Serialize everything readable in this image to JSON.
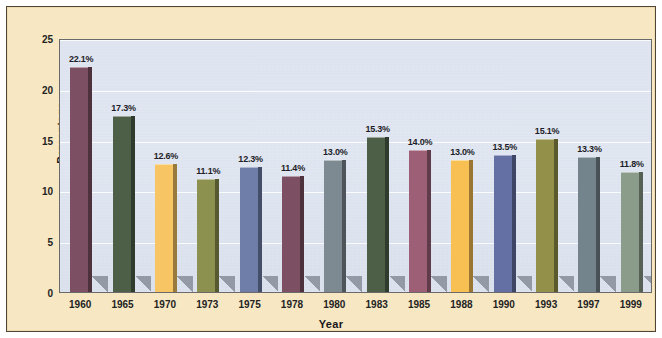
{
  "chart_data": {
    "type": "bar",
    "title": "",
    "xlabel": "Year",
    "ylabel": "Percentage",
    "categories": [
      "1960",
      "1965",
      "1970",
      "1973",
      "1975",
      "1978",
      "1980",
      "1983",
      "1985",
      "1988",
      "1990",
      "1993",
      "1997",
      "1999"
    ],
    "values": [
      22.1,
      17.3,
      12.6,
      11.1,
      12.3,
      11.4,
      13.0,
      15.3,
      14.0,
      13.0,
      13.5,
      15.1,
      13.3,
      11.8
    ],
    "data_labels": [
      "22.1%",
      "17.3%",
      "12.6%",
      "11.1%",
      "12.3%",
      "11.4%",
      "13.0%",
      "15.3%",
      "14.0%",
      "13.0%",
      "13.5%",
      "15.1%",
      "13.3%",
      "11.8%"
    ],
    "bar_colors": [
      "#7d4f62",
      "#4d5f47",
      "#f7c563",
      "#8d9150",
      "#6e7ea8",
      "#7d4f62",
      "#7d8a92",
      "#4d5f47",
      "#9c5f76",
      "#f8bf52",
      "#6470a4",
      "#939149",
      "#73848c",
      "#8b9c8a"
    ],
    "ylim": [
      0,
      25
    ],
    "yticks": [
      0,
      5,
      10,
      15,
      20,
      25
    ],
    "ytick_labels": [
      "0",
      "5",
      "10",
      "15",
      "20",
      "25"
    ],
    "grid": true,
    "grid_axis": "y",
    "legend": "none",
    "plot_background": "#dde3ef",
    "figure_background": "#f7e7c2"
  }
}
